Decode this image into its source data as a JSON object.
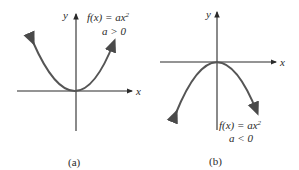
{
  "panels": [
    {
      "id": "a",
      "caption": "(a)",
      "axis_x_label": "x",
      "axis_y_label": "y",
      "function_label": "f(x) = ax",
      "exponent": "2",
      "condition": "a > 0",
      "opens": "up"
    },
    {
      "id": "b",
      "caption": "(b)",
      "axis_x_label": "x",
      "axis_y_label": "y",
      "function_label": "f(x) = ax",
      "exponent": "2",
      "condition": "a < 0",
      "opens": "down"
    }
  ],
  "colors": {
    "curve": "#5a5a5a",
    "axis": "#2a2a2a",
    "background": "#ffffff"
  }
}
